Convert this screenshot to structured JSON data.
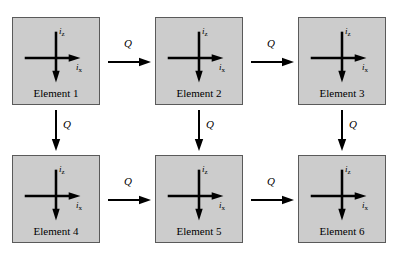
{
  "diagram": {
    "background_color": "#ffffff",
    "box_fill_color": "#cccccc",
    "box_border_color": "#5a5a5a",
    "stroke_color": "#000000",
    "axis_labels": {
      "vertical": "i",
      "vertical_sub": "z",
      "horizontal": "i",
      "horizontal_sub": "x"
    },
    "transition_label": "Q",
    "elements": [
      {
        "label": "Element 1",
        "x": 12,
        "y": 17
      },
      {
        "label": "Element 2",
        "x": 155,
        "y": 17
      },
      {
        "label": "Element 3",
        "x": 298,
        "y": 17
      },
      {
        "label": "Element 4",
        "x": 12,
        "y": 155
      },
      {
        "label": "Element 5",
        "x": 155,
        "y": 155
      },
      {
        "label": "Element 6",
        "x": 298,
        "y": 155
      }
    ],
    "horizontal_arrows": [
      {
        "label": "Q",
        "from": "Element 1",
        "to": "Element 2",
        "x": 108,
        "y": 62
      },
      {
        "label": "Q",
        "from": "Element 2",
        "to": "Element 3",
        "x": 251,
        "y": 62
      },
      {
        "label": "Q",
        "from": "Element 4",
        "to": "Element 5",
        "x": 108,
        "y": 200
      },
      {
        "label": "Q",
        "from": "Element 5",
        "to": "Element 6",
        "x": 251,
        "y": 200
      }
    ],
    "vertical_arrows": [
      {
        "label": "Q",
        "from": "Element 1",
        "to": "Element 4",
        "x": 56,
        "y": 110
      },
      {
        "label": "Q",
        "from": "Element 2",
        "to": "Element 5",
        "x": 199,
        "y": 110
      },
      {
        "label": "Q",
        "from": "Element 3",
        "to": "Element 6",
        "x": 342,
        "y": 110
      }
    ]
  }
}
